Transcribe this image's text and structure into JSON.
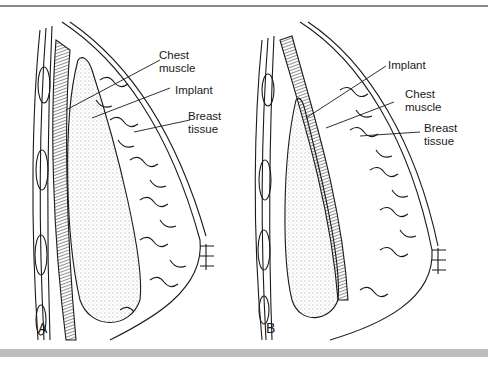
{
  "figure": {
    "panels": [
      {
        "id": "A",
        "letter": "A",
        "labels": {
          "chest_muscle": "Chest\nmuscle",
          "implant": "Implant",
          "breast_tissue": "Breast\ntissue"
        }
      },
      {
        "id": "B",
        "letter": "B",
        "labels": {
          "implant": "Implant",
          "chest_muscle": "Chest\nmuscle",
          "breast_tissue": "Breast\ntissue"
        }
      }
    ],
    "colors": {
      "line": "#1a1a1a",
      "rule": "#8a8a8a",
      "bar": "#bdbdbd"
    }
  }
}
